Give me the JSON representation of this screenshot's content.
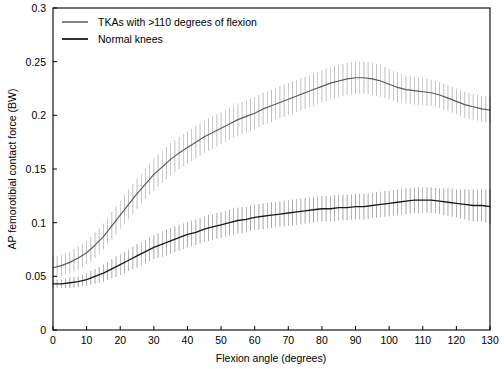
{
  "chart_data": {
    "type": "line",
    "title": "",
    "xlabel": "Flexion angle (degrees)",
    "ylabel": "AP femorotibial contact force (BW)",
    "xlim": [
      0,
      130
    ],
    "ylim": [
      0,
      0.3
    ],
    "xticks": [
      0,
      10,
      20,
      30,
      40,
      50,
      60,
      70,
      80,
      90,
      100,
      110,
      120,
      130
    ],
    "yticks": [
      0,
      0.05,
      0.1,
      0.15,
      0.2,
      0.25,
      0.3
    ],
    "xtick_labels": [
      "0",
      "10",
      "20",
      "30",
      "40",
      "50",
      "60",
      "70",
      "80",
      "90",
      "100",
      "110",
      "120",
      "130"
    ],
    "ytick_labels": [
      "0",
      "0.05",
      "0.1",
      "0.15",
      "0.2",
      "0.25",
      "0.3"
    ],
    "grid": false,
    "legend_position": "top-left",
    "errorbars": true,
    "x": [
      0,
      2.5,
      5,
      7.5,
      10,
      12.5,
      15,
      17.5,
      20,
      22.5,
      25,
      27.5,
      30,
      32.5,
      35,
      37.5,
      40,
      42.5,
      45,
      47.5,
      50,
      52.5,
      55,
      57.5,
      60,
      62.5,
      65,
      67.5,
      70,
      72.5,
      75,
      77.5,
      80,
      82.5,
      85,
      87.5,
      90,
      92.5,
      95,
      97.5,
      100,
      102.5,
      105,
      107.5,
      110,
      112.5,
      115,
      117.5,
      120,
      122.5,
      125,
      127.5,
      130
    ],
    "series": [
      {
        "name": "TKAs with >110 degrees of flexion",
        "color": "#595959",
        "values": [
          0.058,
          0.06,
          0.063,
          0.067,
          0.072,
          0.079,
          0.087,
          0.097,
          0.107,
          0.117,
          0.127,
          0.136,
          0.145,
          0.152,
          0.159,
          0.165,
          0.17,
          0.175,
          0.18,
          0.184,
          0.188,
          0.192,
          0.196,
          0.199,
          0.202,
          0.206,
          0.209,
          0.212,
          0.215,
          0.218,
          0.221,
          0.224,
          0.227,
          0.23,
          0.232,
          0.234,
          0.235,
          0.235,
          0.234,
          0.232,
          0.229,
          0.226,
          0.224,
          0.223,
          0.222,
          0.221,
          0.219,
          0.216,
          0.213,
          0.21,
          0.208,
          0.206,
          0.205
        ],
        "err": [
          0.01,
          0.01,
          0.01,
          0.011,
          0.011,
          0.012,
          0.012,
          0.013,
          0.013,
          0.014,
          0.014,
          0.014,
          0.015,
          0.015,
          0.015,
          0.015,
          0.015,
          0.015,
          0.015,
          0.015,
          0.015,
          0.015,
          0.015,
          0.015,
          0.015,
          0.015,
          0.015,
          0.015,
          0.015,
          0.015,
          0.015,
          0.015,
          0.015,
          0.015,
          0.015,
          0.015,
          0.015,
          0.015,
          0.015,
          0.015,
          0.014,
          0.014,
          0.013,
          0.013,
          0.013,
          0.012,
          0.012,
          0.012,
          0.012,
          0.012,
          0.012,
          0.012,
          0.012
        ]
      },
      {
        "name": "Normal knees",
        "color": "#1a1a1a",
        "values": [
          0.043,
          0.043,
          0.044,
          0.045,
          0.047,
          0.05,
          0.053,
          0.057,
          0.061,
          0.065,
          0.069,
          0.073,
          0.077,
          0.08,
          0.083,
          0.086,
          0.089,
          0.091,
          0.094,
          0.096,
          0.098,
          0.1,
          0.102,
          0.103,
          0.105,
          0.106,
          0.107,
          0.108,
          0.109,
          0.11,
          0.111,
          0.112,
          0.113,
          0.113,
          0.114,
          0.114,
          0.115,
          0.115,
          0.116,
          0.117,
          0.118,
          0.119,
          0.12,
          0.121,
          0.121,
          0.121,
          0.12,
          0.119,
          0.118,
          0.117,
          0.116,
          0.116,
          0.115
        ],
        "err": [
          0.004,
          0.004,
          0.005,
          0.005,
          0.006,
          0.007,
          0.008,
          0.009,
          0.01,
          0.01,
          0.011,
          0.011,
          0.011,
          0.012,
          0.012,
          0.012,
          0.012,
          0.012,
          0.012,
          0.012,
          0.012,
          0.012,
          0.012,
          0.012,
          0.012,
          0.012,
          0.012,
          0.012,
          0.012,
          0.012,
          0.012,
          0.012,
          0.012,
          0.012,
          0.012,
          0.012,
          0.012,
          0.012,
          0.012,
          0.012,
          0.012,
          0.012,
          0.012,
          0.012,
          0.012,
          0.012,
          0.012,
          0.013,
          0.013,
          0.014,
          0.015,
          0.015,
          0.016
        ]
      }
    ]
  },
  "legend": {
    "items": [
      {
        "label": "TKAs with >110 degrees of flexion",
        "color": "#595959"
      },
      {
        "label": "Normal knees",
        "color": "#1a1a1a"
      }
    ]
  },
  "axes": {
    "x_title": "Flexion angle (degrees)",
    "y_title": "AP femorotibial contact force (BW)"
  }
}
